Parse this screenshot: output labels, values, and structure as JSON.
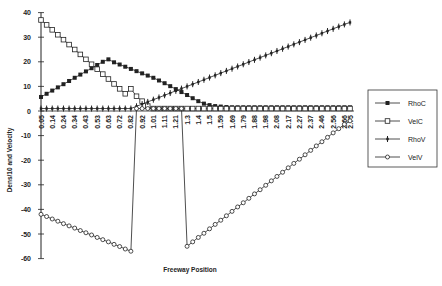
{
  "chart_data": {
    "type": "line",
    "title": "",
    "xlabel": "Freeway Position",
    "ylabel": "Dens/10 and Velocity",
    "ylim": [
      -60,
      40
    ],
    "yticks": [
      40,
      30,
      20,
      10,
      0,
      -10,
      -20,
      -30,
      -40,
      -50,
      -60
    ],
    "grid": false,
    "legend_position": "right",
    "x_tick_labels": [
      "0.05",
      "0.14",
      "0.24",
      "0.34",
      "0.43",
      "0.53",
      "0.63",
      "0.72",
      "0.82",
      "0.92",
      "1.01",
      "1.11",
      "1.21",
      "1.3",
      "1.4",
      "1.5",
      "1.59",
      "1.69",
      "1.79",
      "1.88",
      "1.98",
      "2.08",
      "2.17",
      "2.27",
      "2.37",
      "2.46",
      "2.56",
      "2.66",
      "2.75"
    ],
    "n_points": 56,
    "series": [
      {
        "name": "RhoC",
        "marker": "filled-square",
        "values": [
          5.7,
          7,
          8.3,
          9.6,
          10.9,
          12.2,
          13.5,
          14.8,
          16.1,
          17.4,
          18.7,
          20,
          21,
          19.8,
          18.9,
          18,
          17.1,
          16.2,
          15.3,
          14.4,
          13.5,
          12.4,
          11.3,
          10.1,
          8.9,
          7.7,
          6.5,
          5.2,
          4,
          3,
          2.4,
          2,
          1.8,
          1.6,
          1.5,
          1.5,
          1.5,
          1.5,
          1.5,
          1.5,
          1.5,
          1.5,
          1.5,
          1.5,
          1.5,
          1.5,
          1.5,
          1.5,
          1.5,
          1.5,
          1.5,
          1.5,
          1.5,
          1.5,
          1.5,
          1.5
        ]
      },
      {
        "name": "VelC",
        "marker": "open-square",
        "values": [
          37,
          35,
          33,
          31,
          29,
          27,
          25,
          23,
          21,
          19,
          17,
          15,
          13,
          11,
          9,
          7,
          9,
          6,
          4,
          2,
          1,
          1,
          1,
          1,
          1,
          1,
          1,
          1,
          1,
          1,
          1,
          1,
          1,
          1,
          1,
          1,
          1,
          1,
          1,
          1,
          1,
          1,
          1,
          1,
          1,
          1,
          1,
          1,
          1,
          1,
          1,
          1,
          1,
          1,
          1,
          1
        ]
      },
      {
        "name": "RhoV",
        "marker": "dash",
        "values": [
          1,
          1,
          1,
          1,
          1,
          1,
          1,
          1,
          1,
          1,
          1,
          1,
          1,
          1,
          1,
          1,
          1,
          1.9,
          2.8,
          3.7,
          4.6,
          5.5,
          6.4,
          7.3,
          8.2,
          9.1,
          10,
          10.9,
          11.8,
          12.7,
          13.6,
          14.5,
          15.4,
          16.3,
          17.2,
          18.1,
          19,
          19.9,
          20.8,
          21.7,
          22.6,
          23.5,
          24.4,
          25.3,
          26.2,
          27.1,
          28,
          28.9,
          29.8,
          30.7,
          31.6,
          32.5,
          33.4,
          34.3,
          35.2,
          36
        ]
      },
      {
        "name": "VelV",
        "marker": "open-circle",
        "values": [
          -42,
          -42.9,
          -43.9,
          -44.8,
          -45.8,
          -46.7,
          -47.6,
          -48.6,
          -49.5,
          -50.4,
          -51.4,
          -52.3,
          -53.2,
          -54.2,
          -55.1,
          -56.1,
          -57,
          1,
          1,
          1,
          1,
          1,
          1,
          1,
          1,
          1,
          -55,
          -53.2,
          -51.4,
          -49.7,
          -47.9,
          -46.1,
          -44.4,
          -42.6,
          -40.8,
          -39,
          -37.3,
          -35.5,
          -33.7,
          -32,
          -30.2,
          -28.4,
          -26.6,
          -24.9,
          -23.1,
          -21.3,
          -19.6,
          -17.8,
          -16,
          -14.2,
          -12.5,
          -10.7,
          -8.9,
          -7.2,
          -5.4,
          -4
        ]
      }
    ]
  },
  "axes": {
    "xlabel": "Freeway Position",
    "ylabel": "Dens/10 and Velocity"
  },
  "legend": {
    "items": [
      "RhoC",
      "VelC",
      "RhoV",
      "VelV"
    ]
  },
  "style": {
    "line_color": "#222222",
    "background": "#ffffff"
  }
}
